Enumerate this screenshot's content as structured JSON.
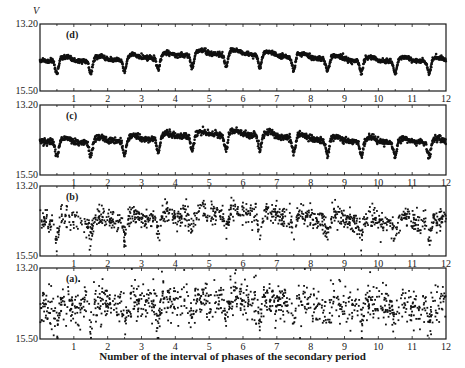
{
  "chart_data": {
    "type": "scatter",
    "title": "",
    "xlabel": "Number of the interval of phases of the secondary period",
    "ylabel": "V",
    "xlim": [
      0,
      12
    ],
    "ylim": [
      13.2,
      15.5
    ],
    "y_inverted": true,
    "x_ticks": [
      1,
      2,
      3,
      4,
      5,
      6,
      7,
      8,
      9,
      10,
      11,
      12
    ],
    "x_minor_step": 0.5,
    "y_tick_labels": [
      "13.20",
      "15.50"
    ],
    "grid": false,
    "legend": null,
    "panels": [
      {
        "label": "(d)",
        "style": "dense-line",
        "baseline_mag": 14.45,
        "dip_depth_mag": 0.45,
        "dip_phase": 0.5,
        "noise_mag": 0.04,
        "description": "Smoothed light curve, brightest around intervals 4-7, minima near each x.5"
      },
      {
        "label": "(c)",
        "style": "dense-line",
        "baseline_mag": 14.4,
        "dip_depth_mag": 0.5,
        "dip_phase": 0.5,
        "noise_mag": 0.05,
        "description": "Smoothed light curve with deeper minima, similar modulation"
      },
      {
        "label": "(b)",
        "style": "scatter",
        "baseline_mag": 14.35,
        "dip_depth_mag": 0.55,
        "dip_phase": 0.5,
        "noise_mag": 0.18,
        "description": "Scatter of observations, clear dips near x.5 for intervals 3-8"
      },
      {
        "label": "(a)",
        "style": "scatter",
        "baseline_mag": 14.45,
        "dip_depth_mag": 0.55,
        "dip_phase": 0.5,
        "noise_mag": 0.3,
        "description": "Raw observations with large scatter and outliers"
      }
    ]
  },
  "axis": {
    "y_top": "13.20",
    "y_bottom": "15.50",
    "y_name": "V"
  }
}
